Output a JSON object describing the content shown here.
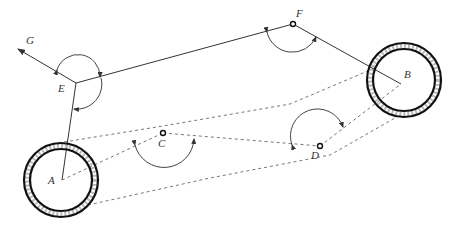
{
  "diagram": {
    "title": "",
    "labels": {
      "A": "A",
      "B": "B",
      "C": "C",
      "D": "D",
      "E": "E",
      "F": "F",
      "G": "G"
    },
    "nodes": {
      "A": {
        "type": "wheel-center"
      },
      "B": {
        "type": "wheel-center"
      },
      "C": {
        "type": "joint"
      },
      "D": {
        "type": "joint"
      },
      "E": {
        "type": "vertex"
      },
      "F": {
        "type": "joint"
      },
      "G": {
        "type": "arrow-direction"
      }
    },
    "solid_links": [
      [
        "A",
        "E"
      ],
      [
        "E",
        "F"
      ],
      [
        "F",
        "B"
      ],
      [
        "E",
        "G"
      ]
    ],
    "dashed_links": [
      [
        "A",
        "C"
      ],
      [
        "C",
        "D"
      ],
      [
        "D",
        "B"
      ]
    ],
    "dashed_boundaries": [
      "upper-tangent",
      "lower-tangent"
    ],
    "angle_arcs": [
      "E-upper",
      "E-right",
      "F",
      "C",
      "D"
    ],
    "colors": {
      "line": "#333333",
      "dash": "#777777",
      "ring": "#111111"
    }
  }
}
